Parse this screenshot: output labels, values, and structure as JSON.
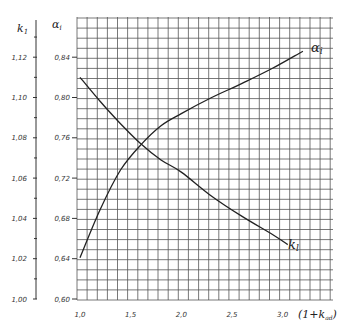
{
  "chart_data": {
    "type": "line",
    "title": "",
    "xlabel": "(1+k_ad)",
    "ylabel_left": "k_1",
    "ylabel_right": "α_i",
    "x_ticks": [
      "1,0",
      "1,5",
      "2,0",
      "2,5",
      "3,0"
    ],
    "x_tick_values": [
      1.0,
      1.5,
      2.0,
      2.5,
      3.0
    ],
    "xlim": [
      1.0,
      3.5
    ],
    "y_k1_ticks": [
      "1,00",
      "1,02",
      "1,04",
      "1,06",
      "1,08",
      "1,10",
      "1,12"
    ],
    "y_k1_tick_values": [
      1.0,
      1.02,
      1.04,
      1.06,
      1.08,
      1.1,
      1.12
    ],
    "y_alpha_ticks": [
      "0,60",
      "0,64",
      "0,68",
      "0,72",
      "0,76",
      "0,80",
      "0,84"
    ],
    "y_alpha_tick_values": [
      0.6,
      0.64,
      0.68,
      0.72,
      0.76,
      0.8,
      0.84
    ],
    "ylim_k1": [
      1.0,
      1.14
    ],
    "ylim_alpha": [
      0.6,
      0.88
    ],
    "grid": true,
    "series": [
      {
        "name": "α_i",
        "axis": "alpha",
        "label": "αi",
        "x": [
          1.0,
          1.2,
          1.4,
          1.6,
          1.8,
          2.0,
          2.3,
          2.6,
          2.9,
          3.2
        ],
        "values": [
          0.641,
          0.689,
          0.728,
          0.753,
          0.772,
          0.784,
          0.8,
          0.814,
          0.829,
          0.846
        ]
      },
      {
        "name": "k_1",
        "axis": "k1",
        "label": "k1",
        "x": [
          1.0,
          1.2,
          1.4,
          1.6,
          1.8,
          2.0,
          2.3,
          2.6,
          2.9,
          3.05
        ],
        "values": [
          1.11,
          1.098,
          1.087,
          1.077,
          1.069,
          1.063,
          1.051,
          1.041,
          1.032,
          1.027
        ]
      }
    ]
  }
}
